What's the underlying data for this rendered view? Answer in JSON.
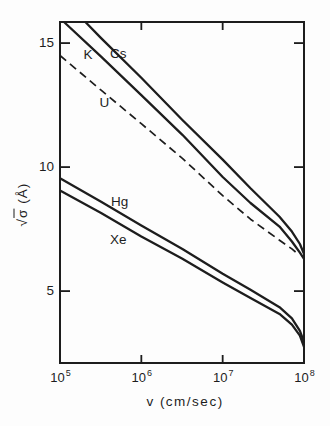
{
  "figure": {
    "background": "#fdfdfd",
    "ink": "#1d1d1d"
  },
  "chart_data": {
    "type": "line",
    "title": "",
    "xlabel": "v (cm/sec)",
    "ylabel": "√σ (Å)",
    "ylabel_parts": {
      "radical": "√",
      "symbol": "σ",
      "unit": "(Å)"
    },
    "x_scale": "log",
    "x_range_log10": [
      5,
      8
    ],
    "y_range": [
      2.1,
      15.85
    ],
    "grid": false,
    "legend": "inline-curve-labels",
    "x_tick_labels": [
      {
        "v": 100000.0,
        "base": "10",
        "exp": "5"
      },
      {
        "v": 1000000.0,
        "base": "10",
        "exp": "6"
      },
      {
        "v": 10000000.0,
        "base": "10",
        "exp": "7"
      },
      {
        "v": 100000000.0,
        "base": "10",
        "exp": "8"
      }
    ],
    "x_ticks_marked_v": [
      1000000.0,
      10000000.0
    ],
    "y_ticks": [
      {
        "value": 15,
        "label": "15"
      },
      {
        "value": 10,
        "label": "10"
      },
      {
        "value": 5,
        "label": "5"
      }
    ],
    "series": [
      {
        "name": "Cs",
        "label": "Cs",
        "dashed": false,
        "label_at": [
          520000.0,
          14.6
        ],
        "points": [
          [
            205000.0,
            15.85
          ],
          [
            320000.0,
            15.2
          ],
          [
            1000000.0,
            13.6
          ],
          [
            3200000.0,
            11.9
          ],
          [
            10000000.0,
            10.3
          ],
          [
            22000000.0,
            9.15
          ],
          [
            50000000.0,
            8.0
          ],
          [
            71000000.0,
            7.4
          ],
          [
            89000000.0,
            6.9
          ],
          [
            100000000.0,
            6.5
          ]
        ]
      },
      {
        "name": "K",
        "label": "K",
        "dashed": false,
        "label_at": [
          220000.0,
          14.55
        ],
        "points": [
          [
            112000.0,
            15.85
          ],
          [
            320000.0,
            14.45
          ],
          [
            1000000.0,
            12.9
          ],
          [
            3200000.0,
            11.3
          ],
          [
            10000000.0,
            9.6
          ],
          [
            22000000.0,
            8.55
          ],
          [
            50000000.0,
            7.6
          ],
          [
            71000000.0,
            7.0
          ],
          [
            89000000.0,
            6.55
          ],
          [
            100000000.0,
            6.3
          ]
        ]
      },
      {
        "name": "U",
        "label": "U",
        "dashed": true,
        "label_at": [
          350000.0,
          12.6
        ],
        "points": [
          [
            100000.0,
            14.5
          ],
          [
            320000.0,
            13.1
          ],
          [
            1000000.0,
            11.75
          ],
          [
            3200000.0,
            10.35
          ],
          [
            10000000.0,
            8.85
          ],
          [
            22000000.0,
            7.9
          ],
          [
            50000000.0,
            7.05
          ],
          [
            71000000.0,
            6.7
          ],
          [
            84000000.0,
            6.5
          ]
        ]
      },
      {
        "name": "Hg",
        "label": "Hg",
        "dashed": false,
        "label_at": [
          540000.0,
          8.6
        ],
        "points": [
          [
            100000.0,
            9.55
          ],
          [
            320000.0,
            8.6
          ],
          [
            1000000.0,
            7.65
          ],
          [
            3200000.0,
            6.7
          ],
          [
            10000000.0,
            5.7
          ],
          [
            22000000.0,
            5.05
          ],
          [
            50000000.0,
            4.35
          ],
          [
            71000000.0,
            3.9
          ],
          [
            89000000.0,
            3.4
          ],
          [
            100000000.0,
            2.95
          ]
        ]
      },
      {
        "name": "Xe",
        "label": "Xe",
        "dashed": false,
        "label_at": [
          520000.0,
          7.1
        ],
        "points": [
          [
            100000.0,
            9.05
          ],
          [
            320000.0,
            8.15
          ],
          [
            1000000.0,
            7.2
          ],
          [
            3200000.0,
            6.3
          ],
          [
            10000000.0,
            5.35
          ],
          [
            22000000.0,
            4.72
          ],
          [
            50000000.0,
            4.08
          ],
          [
            71000000.0,
            3.65
          ],
          [
            89000000.0,
            3.2
          ],
          [
            100000000.0,
            2.75
          ]
        ]
      }
    ]
  }
}
